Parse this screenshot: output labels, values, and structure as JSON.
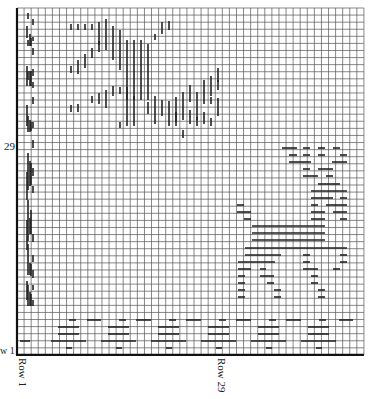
{
  "chart_data": {
    "type": "knitting-chart",
    "title": "",
    "grid": {
      "cols": 49,
      "rows": 49,
      "left": 17,
      "top": 8,
      "cell": 7.08,
      "line_color": "#555555",
      "axis_color": "#111111",
      "mark_color": "#222222"
    },
    "labels": {
      "left_row_marker": "29",
      "left_row_marker_bottom": "w 1",
      "bottom_start": "Row 1",
      "bottom_mid": "Row 29"
    },
    "vertical_marks": [
      [
        27,
        26,
        38
      ],
      [
        28,
        13,
        19
      ],
      [
        28,
        40,
        46
      ],
      [
        30,
        34,
        46
      ],
      [
        31,
        38,
        46
      ],
      [
        33,
        37,
        41
      ],
      [
        33,
        19,
        25
      ],
      [
        33,
        48,
        55
      ],
      [
        27,
        66,
        86
      ],
      [
        30,
        71,
        86
      ],
      [
        31,
        71,
        86
      ],
      [
        33,
        69,
        76
      ],
      [
        33,
        82,
        88
      ],
      [
        28,
        71,
        80
      ],
      [
        33,
        97,
        104
      ],
      [
        27,
        105,
        126
      ],
      [
        28,
        116,
        132
      ],
      [
        30,
        120,
        132
      ],
      [
        31,
        122,
        131
      ],
      [
        33,
        122,
        128
      ],
      [
        33,
        140,
        148
      ],
      [
        27,
        172,
        200
      ],
      [
        28,
        153,
        190
      ],
      [
        30,
        161,
        186
      ],
      [
        31,
        163,
        185
      ],
      [
        33,
        168,
        176
      ],
      [
        33,
        186,
        193
      ],
      [
        27,
        220,
        250
      ],
      [
        28,
        200,
        241
      ],
      [
        30,
        218,
        234
      ],
      [
        31,
        210,
        234
      ],
      [
        33,
        234,
        242
      ],
      [
        33,
        255,
        262
      ],
      [
        27,
        281,
        300
      ],
      [
        28,
        244,
        275
      ],
      [
        30,
        263,
        275
      ],
      [
        31,
        264,
        276
      ],
      [
        33,
        270,
        278
      ],
      [
        33,
        300,
        306
      ],
      [
        28,
        285,
        306
      ],
      [
        30,
        292,
        306
      ],
      [
        31,
        294,
        306
      ],
      [
        33,
        285,
        290
      ],
      [
        71,
        24,
        30
      ],
      [
        78,
        24,
        30
      ],
      [
        85,
        24,
        30
      ],
      [
        92,
        24,
        30
      ],
      [
        99,
        22,
        38
      ],
      [
        106,
        19,
        50
      ],
      [
        113,
        26,
        60
      ],
      [
        120,
        30,
        70
      ],
      [
        127,
        40,
        100
      ],
      [
        134,
        40,
        100
      ],
      [
        141,
        40,
        100
      ],
      [
        148,
        44,
        100
      ],
      [
        155,
        34,
        40
      ],
      [
        162,
        22,
        34
      ],
      [
        169,
        21,
        30
      ],
      [
        78,
        60,
        68
      ],
      [
        85,
        54,
        68
      ],
      [
        92,
        48,
        58
      ],
      [
        99,
        41,
        52
      ],
      [
        99,
        38,
        45
      ],
      [
        71,
        66,
        73
      ],
      [
        78,
        68,
        74
      ],
      [
        92,
        96,
        103
      ],
      [
        99,
        93,
        104
      ],
      [
        106,
        90,
        108
      ],
      [
        71,
        105,
        112
      ],
      [
        78,
        104,
        112
      ],
      [
        113,
        86,
        96
      ],
      [
        120,
        87,
        94
      ],
      [
        127,
        87,
        126
      ],
      [
        120,
        122,
        128
      ],
      [
        134,
        96,
        126
      ],
      [
        148,
        102,
        114
      ],
      [
        155,
        96,
        124
      ],
      [
        162,
        100,
        116
      ],
      [
        169,
        101,
        122
      ],
      [
        176,
        97,
        126
      ],
      [
        183,
        92,
        120
      ],
      [
        190,
        85,
        102
      ],
      [
        197,
        92,
        120
      ],
      [
        204,
        80,
        104
      ],
      [
        211,
        76,
        96
      ],
      [
        218,
        68,
        82
      ],
      [
        183,
        130,
        138
      ],
      [
        169,
        122,
        126
      ],
      [
        176,
        112,
        122
      ],
      [
        190,
        110,
        124
      ],
      [
        197,
        117,
        126
      ],
      [
        204,
        112,
        124
      ],
      [
        211,
        118,
        126
      ],
      [
        218,
        98,
        110
      ],
      [
        218,
        110,
        116
      ],
      [
        211,
        97,
        104
      ],
      [
        218,
        80,
        90
      ]
    ],
    "horizontal_marks": [
      [
        282,
        297,
        148
      ],
      [
        303,
        310,
        148
      ],
      [
        318,
        325,
        148
      ],
      [
        333,
        340,
        148
      ],
      [
        289,
        297,
        155
      ],
      [
        303,
        310,
        155
      ],
      [
        318,
        325,
        155
      ],
      [
        340,
        347,
        155
      ],
      [
        289,
        311,
        162
      ],
      [
        332,
        347,
        162
      ],
      [
        303,
        310,
        169
      ],
      [
        318,
        333,
        169
      ],
      [
        303,
        318,
        176
      ],
      [
        326,
        333,
        176
      ],
      [
        318,
        340,
        184
      ],
      [
        311,
        347,
        191
      ],
      [
        311,
        333,
        198
      ],
      [
        340,
        347,
        198
      ],
      [
        237,
        244,
        205
      ],
      [
        311,
        318,
        205
      ],
      [
        326,
        347,
        205
      ],
      [
        237,
        251,
        212
      ],
      [
        311,
        325,
        212
      ],
      [
        333,
        347,
        212
      ],
      [
        244,
        251,
        219
      ],
      [
        311,
        325,
        219
      ],
      [
        340,
        347,
        219
      ],
      [
        252,
        325,
        226
      ],
      [
        252,
        325,
        233
      ],
      [
        252,
        325,
        240
      ],
      [
        245,
        347,
        248
      ],
      [
        245,
        281,
        255
      ],
      [
        303,
        310,
        255
      ],
      [
        340,
        347,
        255
      ],
      [
        238,
        275,
        262
      ],
      [
        303,
        310,
        262
      ],
      [
        340,
        347,
        262
      ],
      [
        238,
        251,
        269
      ],
      [
        260,
        266,
        269
      ],
      [
        303,
        318,
        269
      ],
      [
        333,
        340,
        269
      ],
      [
        238,
        245,
        276
      ],
      [
        260,
        274,
        276
      ],
      [
        311,
        318,
        276
      ],
      [
        238,
        245,
        283
      ],
      [
        267,
        274,
        283
      ],
      [
        311,
        318,
        283
      ],
      [
        238,
        245,
        290
      ],
      [
        274,
        281,
        290
      ],
      [
        318,
        325,
        290
      ],
      [
        238,
        245,
        297
      ],
      [
        274,
        281,
        297
      ],
      [
        318,
        325,
        297
      ],
      [
        69,
        76,
        320
      ],
      [
        87,
        101,
        320
      ],
      [
        119,
        126,
        320
      ],
      [
        136,
        151,
        320
      ],
      [
        169,
        176,
        320
      ],
      [
        186,
        201,
        320
      ],
      [
        219,
        226,
        320
      ],
      [
        236,
        251,
        320
      ],
      [
        269,
        276,
        320
      ],
      [
        286,
        301,
        320
      ],
      [
        319,
        326,
        320
      ],
      [
        339,
        353,
        320
      ],
      [
        58,
        79,
        327
      ],
      [
        108,
        129,
        327
      ],
      [
        158,
        179,
        327
      ],
      [
        208,
        229,
        327
      ],
      [
        258,
        279,
        327
      ],
      [
        308,
        329,
        327
      ],
      [
        58,
        79,
        334
      ],
      [
        108,
        129,
        334
      ],
      [
        158,
        179,
        334
      ],
      [
        208,
        229,
        334
      ],
      [
        258,
        279,
        334
      ],
      [
        308,
        329,
        334
      ],
      [
        51,
        86,
        341
      ],
      [
        101,
        136,
        341
      ],
      [
        151,
        186,
        341
      ],
      [
        201,
        236,
        341
      ],
      [
        251,
        286,
        341
      ],
      [
        301,
        336,
        341
      ],
      [
        20,
        30,
        341
      ],
      [
        66,
        72,
        348
      ],
      [
        116,
        122,
        348
      ],
      [
        166,
        172,
        348
      ],
      [
        216,
        222,
        348
      ],
      [
        266,
        272,
        348
      ],
      [
        316,
        322,
        348
      ]
    ]
  }
}
